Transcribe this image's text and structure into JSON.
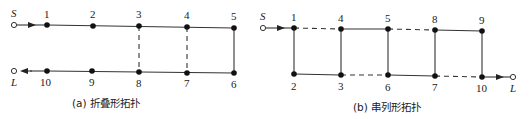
{
  "panels": [
    {
      "id": "a",
      "caption": "(a) 折叠形拓扑",
      "source_label": "S",
      "sink_label": "L",
      "top_nodes": [
        "1",
        "2",
        "3",
        "4",
        "5"
      ],
      "bottom_nodes": [
        "10",
        "9",
        "8",
        "7",
        "6"
      ],
      "solid_edges": [
        [
          "S",
          "1"
        ],
        [
          "1",
          "2"
        ],
        [
          "2",
          "3"
        ],
        [
          "3",
          "4"
        ],
        [
          "4",
          "5"
        ],
        [
          "5",
          "6"
        ],
        [
          "6",
          "7"
        ],
        [
          "7",
          "8"
        ],
        [
          "8",
          "9"
        ],
        [
          "9",
          "10"
        ],
        [
          "10",
          "L"
        ]
      ],
      "dashed_edges": [
        [
          "3",
          "8"
        ],
        [
          "4",
          "7"
        ]
      ]
    },
    {
      "id": "b",
      "caption": "(b) 串列形拓扑",
      "source_label": "S",
      "sink_label": "L",
      "top_nodes": [
        "1",
        "4",
        "5",
        "8",
        "9"
      ],
      "bottom_nodes": [
        "2",
        "3",
        "6",
        "7",
        "10"
      ],
      "solid_edges": [
        [
          "S",
          "1"
        ],
        [
          "1",
          "2"
        ],
        [
          "2",
          "3"
        ],
        [
          "3",
          "4"
        ],
        [
          "4",
          "5"
        ],
        [
          "5",
          "6"
        ],
        [
          "6",
          "7"
        ],
        [
          "7",
          "8"
        ],
        [
          "8",
          "9"
        ],
        [
          "9",
          "10"
        ],
        [
          "10",
          "L"
        ]
      ],
      "dashed_edges": [
        [
          "1",
          "4"
        ],
        [
          "5",
          "8"
        ],
        [
          "3",
          "6"
        ],
        [
          "7",
          "10"
        ]
      ]
    }
  ]
}
